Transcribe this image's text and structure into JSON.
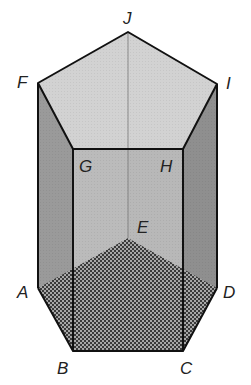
{
  "figure": {
    "type": "pentagonal-prism",
    "colors": {
      "top_face": "#d2d2d2",
      "left_face": "#9a9a9a",
      "right_face": "#8f8f8f",
      "front_face": "#b4b4b4",
      "back_face": "#c4c4c4",
      "base_hatch_dark": "#3a3a3a",
      "base_hatch_light": "#a8a8a8",
      "edge": "#111111",
      "hidden_edge": "#777777"
    },
    "vertices": {
      "A": {
        "label": "A",
        "x": 38,
        "y": 288
      },
      "B": {
        "label": "B",
        "x": 73,
        "y": 351
      },
      "C": {
        "label": "C",
        "x": 183,
        "y": 351
      },
      "D": {
        "label": "D",
        "x": 217,
        "y": 288
      },
      "E": {
        "label": "E",
        "x": 128,
        "y": 238
      },
      "F": {
        "label": "F",
        "x": 38,
        "y": 83
      },
      "G": {
        "label": "G",
        "x": 73,
        "y": 149
      },
      "H": {
        "label": "H",
        "x": 183,
        "y": 149
      },
      "I": {
        "label": "I",
        "x": 217,
        "y": 84
      },
      "J": {
        "label": "J",
        "x": 128,
        "y": 32
      }
    },
    "labels": {
      "A": "A",
      "B": "B",
      "C": "C",
      "D": "D",
      "E": "E",
      "F": "F",
      "G": "G",
      "H": "H",
      "I": "I",
      "J": "J"
    }
  }
}
